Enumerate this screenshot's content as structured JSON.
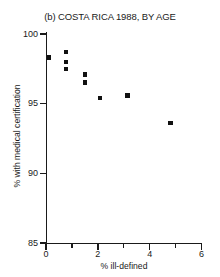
{
  "chart_data": {
    "type": "scatter",
    "title": "(b) COSTA RICA 1988, BY AGE",
    "xlabel": "% ill-defined",
    "ylabel": "% with medical certification",
    "xlim": [
      0,
      6
    ],
    "ylim": [
      85,
      100
    ],
    "xticks": [
      0,
      2,
      4,
      6
    ],
    "xticks_labels": [
      "0",
      "2",
      "4",
      "6"
    ],
    "xticks_minor": [
      1,
      3,
      5
    ],
    "yticks": [
      85,
      90,
      95,
      100
    ],
    "yticks_labels": [
      "85",
      "90",
      "95",
      "100"
    ],
    "grid": false,
    "legend": null,
    "marker": "filled-square",
    "marker_color": "#111111",
    "points": [
      {
        "x": 0.12,
        "y": 98.3
      },
      {
        "x": 0.77,
        "y": 98.7
      },
      {
        "x": 0.77,
        "y": 98.0
      },
      {
        "x": 0.77,
        "y": 97.5
      },
      {
        "x": 1.51,
        "y": 97.1
      },
      {
        "x": 1.51,
        "y": 96.5
      },
      {
        "x": 2.09,
        "y": 95.4
      },
      {
        "x": 3.14,
        "y": 95.6
      },
      {
        "x": 4.8,
        "y": 93.6
      }
    ]
  }
}
